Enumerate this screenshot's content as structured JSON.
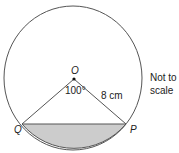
{
  "diagram": {
    "center_label": "O",
    "point_left": "Q",
    "point_right": "P",
    "angle_label": "100°",
    "radius_label": "8 cm",
    "note_line1": "Not to",
    "note_line2": "scale",
    "colors": {
      "stroke": "#444444",
      "segment_fill": "#cccccc"
    }
  }
}
